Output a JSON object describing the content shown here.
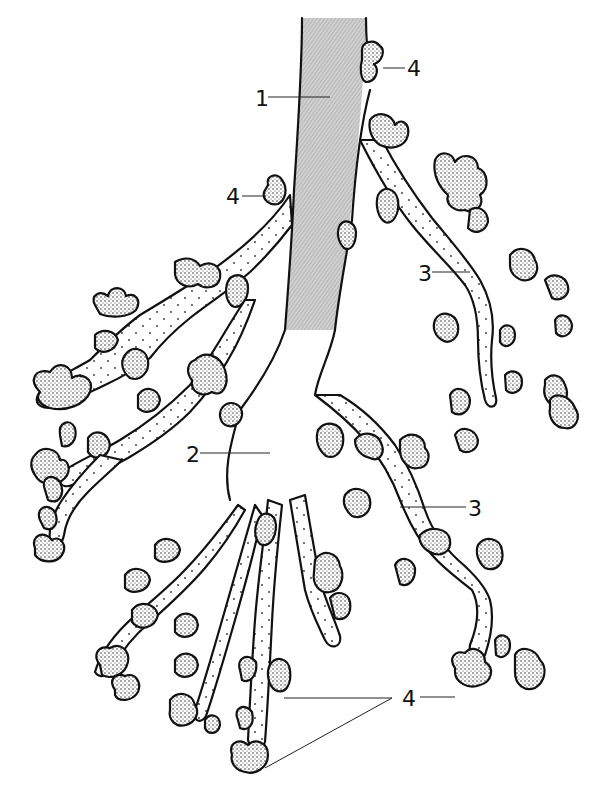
{
  "figure": {
    "labels": [
      {
        "id": "1",
        "text": "1",
        "x": 257,
        "y": 101,
        "target": "trachea / main bronchus (shaded)"
      },
      {
        "id": "2",
        "text": "2",
        "x": 188,
        "y": 461,
        "target": "bronchus branch"
      },
      {
        "id": "3a",
        "text": "3",
        "x": 420,
        "y": 281,
        "target": "bronchiole (right upper)"
      },
      {
        "id": "3b",
        "text": "3",
        "x": 470,
        "y": 512,
        "target": "bronchiole (right lower)"
      },
      {
        "id": "4a",
        "text": "4",
        "x": 408,
        "y": 48,
        "target": "alveolar bud (top)"
      },
      {
        "id": "4b",
        "text": "4",
        "x": 228,
        "y": 199,
        "target": "alveolar bud (left of trunk)"
      },
      {
        "id": "4c",
        "text": "4",
        "x": 403,
        "y": 702,
        "target": "alveolar buds (bottom)"
      }
    ],
    "colors": {
      "background": "#ffffff",
      "ink": "#111111",
      "trachea_shade": "#bdbdbd"
    }
  }
}
